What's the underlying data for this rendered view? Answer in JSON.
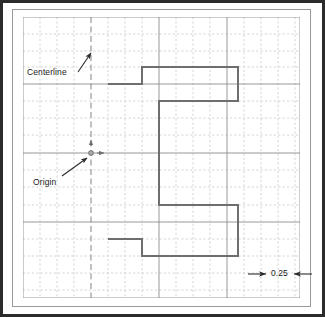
{
  "canvas": {
    "width": 325,
    "height": 317,
    "background": "#ffffff"
  },
  "frame": {
    "outer_border_color": "#2b2b2b",
    "inner_border_color": "#9a9a9a",
    "outer": {
      "x": 0,
      "y": 0,
      "width": 325,
      "height": 317
    },
    "inner": {
      "x": 12,
      "y": 9,
      "width": 299,
      "height": 298
    }
  },
  "grid": {
    "minor_spacing_px": 17,
    "major_spacing_px": 68,
    "minor_color": "#c9c9c9",
    "major_color": "#8c8c8c",
    "minor_style": "dashed",
    "major_style": "solid",
    "origin_x_px": 91,
    "origin_y_px": 153,
    "left_px": 23,
    "top_px": 17,
    "right_px": 300,
    "bottom_px": 298
  },
  "centerline": {
    "color": "#8f8f8f",
    "style": "dashed",
    "x_px": 91,
    "y_top_px": 17,
    "y_bottom_px": 298
  },
  "origin_marker": {
    "x_px": 91,
    "y_px": 153,
    "color": "#6f6f6f",
    "axis_arrow_up": true,
    "axis_arrow_right": true
  },
  "profile": {
    "stroke_color": "#6e6e6e",
    "stroke_width": 2,
    "fill": "none",
    "points_px": [
      [
        108,
        84
      ],
      [
        142,
        84
      ],
      [
        142,
        67
      ],
      [
        238,
        67
      ],
      [
        238,
        101
      ],
      [
        159,
        101
      ],
      [
        159,
        205
      ],
      [
        238,
        205
      ],
      [
        238,
        256
      ],
      [
        142,
        256
      ],
      [
        142,
        239
      ],
      [
        108,
        239
      ]
    ]
  },
  "labels": {
    "centerline": "Centerline",
    "origin": "Origin",
    "dimension": "0.25"
  },
  "leaders": {
    "centerline_arrow": {
      "from_px": [
        78,
        72
      ],
      "to_px": [
        92,
        52
      ]
    },
    "origin_arrow": {
      "from_px": [
        62,
        176
      ],
      "to_px": [
        88,
        157
      ]
    }
  },
  "dimension": {
    "value": "0.25",
    "left_arrow": {
      "tail_px": [
        249,
        274
      ],
      "head_px": [
        266,
        274
      ]
    },
    "right_arrow": {
      "tail_px": [
        311,
        274
      ],
      "head_px": [
        294,
        274
      ]
    },
    "color": "#2b2b2b"
  }
}
